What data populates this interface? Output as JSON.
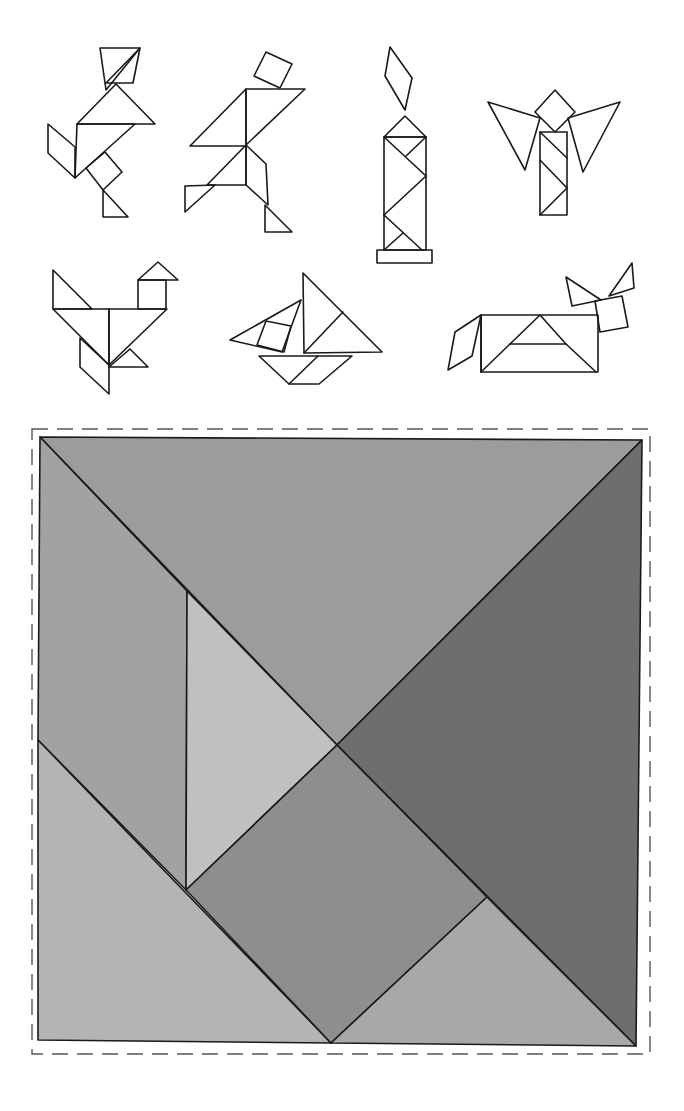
{
  "page": {
    "figures": [
      {
        "id": "figure-runner",
        "label": "Running figure"
      },
      {
        "id": "figure-walker",
        "label": "Walking figure"
      },
      {
        "id": "figure-candle",
        "label": "Candle"
      },
      {
        "id": "figure-angel",
        "label": "Angel"
      },
      {
        "id": "figure-bird",
        "label": "Bird"
      },
      {
        "id": "figure-sailboat",
        "label": "Sailboat"
      },
      {
        "id": "figure-animal",
        "label": "Animal"
      }
    ],
    "puzzle": {
      "label": "Tangram square with seven pieces",
      "cut_line": "dashed",
      "pieces": [
        {
          "name": "large-triangle-top",
          "color": "#9c9c9c"
        },
        {
          "name": "large-triangle-right",
          "color": "#6e6e6e"
        },
        {
          "name": "parallelogram-left",
          "color": "#a2a2a2"
        },
        {
          "name": "medium-triangle-bottom-left",
          "color": "#b4b4b4"
        },
        {
          "name": "small-triangle-center-left",
          "color": "#c0c0c0"
        },
        {
          "name": "square-center",
          "color": "#8e8e8e"
        },
        {
          "name": "small-triangle-bottom-right",
          "color": "#a8a8a8"
        }
      ]
    }
  }
}
